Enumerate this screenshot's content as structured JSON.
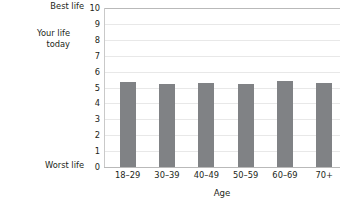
{
  "chart_data": {
    "type": "bar",
    "title": "",
    "categories": [
      "18–29",
      "30–39",
      "40–49",
      "50–59",
      "60–69",
      "70+"
    ],
    "values": [
      5.35,
      5.2,
      5.3,
      5.25,
      5.4,
      5.3
    ],
    "series": [
      {
        "name": "Your life today",
        "values": [
          5.35,
          5.2,
          5.3,
          5.25,
          5.4,
          5.3
        ]
      }
    ],
    "xlabel": "Age",
    "ylabel": "Your life today",
    "ylim": [
      0,
      10
    ],
    "y_ticks": [
      0,
      1,
      2,
      3,
      4,
      5,
      6,
      7,
      8,
      9,
      10
    ],
    "y_tick_labels": [
      "0",
      "1",
      "2",
      "3",
      "4",
      "5",
      "6",
      "7",
      "8",
      "9",
      "10"
    ],
    "y_endpoint_labels": {
      "max": "Best life",
      "min": "Worst life"
    },
    "grid": true,
    "legend": false,
    "bar_color": "#808285",
    "gridline_color": "#e8e8e8",
    "axis_color": "#b9b9b9",
    "text_color": "#231f20"
  },
  "axis_labels": {
    "best_life": "Best life",
    "worst_life": "Worst life",
    "y_title_line1": "Your life",
    "y_title_line2": "today",
    "y_title": "Your life\ntoday",
    "x_title": "Age"
  }
}
